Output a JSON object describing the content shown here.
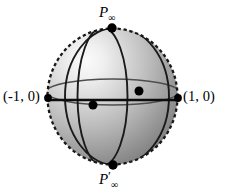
{
  "figure": {
    "background_color": "#ffffff",
    "labels": {
      "top_pole": "P",
      "top_pole_sub": "∞",
      "bottom_pole": "P",
      "bottom_pole_prime": "′",
      "bottom_pole_sub": "∞",
      "left_point": "(-1, 0)",
      "right_point": "(1, 0)"
    },
    "sphere": {
      "center_x": 112.5,
      "center_y": 96.5,
      "radius_x": 65,
      "radius_y": 68,
      "outline_style": "dashed",
      "outline_color": "#1a1a1a",
      "outline_width": 2.2,
      "dash_pattern": "3.2 2.6",
      "fill_light": "#f2f2f2",
      "fill_mid": "#b8b8b8",
      "fill_dark": "#6e6e6e",
      "highlight_x": 78,
      "highlight_y": 58
    },
    "curves": [
      {
        "name": "meridian-left",
        "type": "ellipse-vertical",
        "semi_width": 25,
        "color": "#161616",
        "width": 1.9
      },
      {
        "name": "meridian-right",
        "type": "ellipse-vertical",
        "semi_width": 52,
        "color": "#161616",
        "width": 1.9
      },
      {
        "name": "equator-ellipse",
        "type": "ellipse-horizontal",
        "center_y": 92,
        "semi_height": 13,
        "color": "#4a4a4a",
        "width": 1.4
      },
      {
        "name": "real-axis",
        "type": "line-horizontal",
        "y": 100,
        "color": "#0d0d0d",
        "width": 2.4
      }
    ],
    "points": [
      {
        "name": "north-pole",
        "x": 112,
        "y": 28,
        "r": 4.6
      },
      {
        "name": "south-pole",
        "x": 113,
        "y": 165,
        "r": 4.6
      },
      {
        "name": "left-real-point",
        "x": 48,
        "y": 97,
        "r": 3.8
      },
      {
        "name": "right-real-point",
        "x": 178,
        "y": 97,
        "r": 3.8
      },
      {
        "name": "origin-intersection",
        "x": 93,
        "y": 105,
        "r": 4.4
      },
      {
        "name": "equator-intersection",
        "x": 139,
        "y": 91,
        "r": 4.4
      }
    ]
  }
}
